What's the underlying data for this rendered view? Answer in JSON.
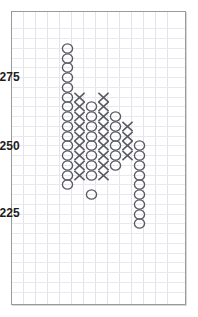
{
  "chart_data": {
    "type": "scatter",
    "chart_style": "point-and-figure",
    "title": "",
    "subtitle": "",
    "xlabel": "",
    "ylabel": "",
    "grid": true,
    "legend": null,
    "y_tick_labels": [
      "275",
      "250",
      "225"
    ],
    "y_tick_values": [
      275,
      250,
      225
    ],
    "ylim": [
      200,
      290
    ],
    "box_size": 3.57,
    "reversal": 3,
    "colors": {
      "symbol": "#595964",
      "grid_vertical": "#e3e3ea",
      "grid_horizontal": "#e8e8ee",
      "frame": "#9a9a9a",
      "background": "#ffffff",
      "label_text": "#1d1d1d"
    },
    "columns": [
      {
        "index": 1,
        "symbol": "O",
        "count": 15,
        "top_value": 282.1,
        "bottom_value": 232.1
      },
      {
        "index": 2,
        "symbol": "X",
        "count": 10,
        "top_value": 267.9,
        "bottom_value": 235.7
      },
      {
        "index": 3,
        "symbol": "O",
        "count": 10,
        "top_value": 264.3,
        "bottom_value": 232.1
      },
      {
        "index": 4,
        "symbol": "X",
        "count": 11,
        "top_value": 267.9,
        "bottom_value": 232.1
      },
      {
        "index": 5,
        "symbol": "O",
        "count": 8,
        "top_value": 264.3,
        "bottom_value": 239.3
      },
      {
        "index": 6,
        "symbol": "X",
        "count": 5,
        "top_value": 257.1,
        "bottom_value": 242.9
      },
      {
        "index": 7,
        "symbol": "O",
        "count": 10,
        "top_value": 253.6,
        "bottom_value": 221.4
      }
    ],
    "points": [
      {
        "col": 1,
        "sym": "O",
        "x": 67,
        "y": 48
      },
      {
        "col": 1,
        "sym": "O",
        "x": 67,
        "y": 58
      },
      {
        "col": 1,
        "sym": "O",
        "x": 67,
        "y": 67
      },
      {
        "col": 1,
        "sym": "O",
        "x": 67,
        "y": 77
      },
      {
        "col": 1,
        "sym": "O",
        "x": 67,
        "y": 87
      },
      {
        "col": 1,
        "sym": "O",
        "x": 67,
        "y": 97
      },
      {
        "col": 1,
        "sym": "O",
        "x": 67,
        "y": 106
      },
      {
        "col": 1,
        "sym": "O",
        "x": 67,
        "y": 116
      },
      {
        "col": 1,
        "sym": "O",
        "x": 67,
        "y": 126
      },
      {
        "col": 1,
        "sym": "O",
        "x": 67,
        "y": 136
      },
      {
        "col": 1,
        "sym": "O",
        "x": 67,
        "y": 145
      },
      {
        "col": 1,
        "sym": "O",
        "x": 67,
        "y": 155
      },
      {
        "col": 1,
        "sym": "O",
        "x": 67,
        "y": 165
      },
      {
        "col": 1,
        "sym": "O",
        "x": 67,
        "y": 175
      },
      {
        "col": 1,
        "sym": "O",
        "x": 67,
        "y": 184
      },
      {
        "col": 2,
        "sym": "X",
        "x": 79,
        "y": 97
      },
      {
        "col": 2,
        "sym": "X",
        "x": 79,
        "y": 106
      },
      {
        "col": 2,
        "sym": "X",
        "x": 79,
        "y": 116
      },
      {
        "col": 2,
        "sym": "X",
        "x": 79,
        "y": 126
      },
      {
        "col": 2,
        "sym": "X",
        "x": 79,
        "y": 136
      },
      {
        "col": 2,
        "sym": "X",
        "x": 79,
        "y": 145
      },
      {
        "col": 2,
        "sym": "X",
        "x": 79,
        "y": 155
      },
      {
        "col": 2,
        "sym": "X",
        "x": 79,
        "y": 165
      },
      {
        "col": 2,
        "sym": "X",
        "x": 79,
        "y": 175
      },
      {
        "col": 3,
        "sym": "O",
        "x": 91,
        "y": 106
      },
      {
        "col": 3,
        "sym": "O",
        "x": 91,
        "y": 116
      },
      {
        "col": 3,
        "sym": "O",
        "x": 91,
        "y": 126
      },
      {
        "col": 3,
        "sym": "O",
        "x": 91,
        "y": 136
      },
      {
        "col": 3,
        "sym": "O",
        "x": 91,
        "y": 145
      },
      {
        "col": 3,
        "sym": "O",
        "x": 91,
        "y": 155
      },
      {
        "col": 3,
        "sym": "O",
        "x": 91,
        "y": 165
      },
      {
        "col": 3,
        "sym": "O",
        "x": 91,
        "y": 175
      },
      {
        "col": 3,
        "sym": "O",
        "x": 91,
        "y": 194
      },
      {
        "col": 4,
        "sym": "X",
        "x": 103,
        "y": 97
      },
      {
        "col": 4,
        "sym": "X",
        "x": 103,
        "y": 106
      },
      {
        "col": 4,
        "sym": "X",
        "x": 103,
        "y": 116
      },
      {
        "col": 4,
        "sym": "X",
        "x": 103,
        "y": 126
      },
      {
        "col": 4,
        "sym": "X",
        "x": 103,
        "y": 136
      },
      {
        "col": 4,
        "sym": "X",
        "x": 103,
        "y": 145
      },
      {
        "col": 4,
        "sym": "X",
        "x": 103,
        "y": 155
      },
      {
        "col": 4,
        "sym": "X",
        "x": 103,
        "y": 165
      },
      {
        "col": 4,
        "sym": "X",
        "x": 103,
        "y": 175
      },
      {
        "col": 5,
        "sym": "O",
        "x": 115,
        "y": 116
      },
      {
        "col": 5,
        "sym": "O",
        "x": 115,
        "y": 126
      },
      {
        "col": 5,
        "sym": "O",
        "x": 115,
        "y": 136
      },
      {
        "col": 5,
        "sym": "O",
        "x": 115,
        "y": 145
      },
      {
        "col": 5,
        "sym": "O",
        "x": 115,
        "y": 155
      },
      {
        "col": 5,
        "sym": "O",
        "x": 115,
        "y": 165
      },
      {
        "col": 6,
        "sym": "X",
        "x": 127,
        "y": 126
      },
      {
        "col": 6,
        "sym": "X",
        "x": 127,
        "y": 136
      },
      {
        "col": 6,
        "sym": "X",
        "x": 127,
        "y": 145
      },
      {
        "col": 6,
        "sym": "X",
        "x": 127,
        "y": 155
      },
      {
        "col": 7,
        "sym": "O",
        "x": 139,
        "y": 145
      },
      {
        "col": 7,
        "sym": "O",
        "x": 139,
        "y": 155
      },
      {
        "col": 7,
        "sym": "O",
        "x": 139,
        "y": 165
      },
      {
        "col": 7,
        "sym": "O",
        "x": 139,
        "y": 175
      },
      {
        "col": 7,
        "sym": "O",
        "x": 139,
        "y": 184
      },
      {
        "col": 7,
        "sym": "O",
        "x": 139,
        "y": 194
      },
      {
        "col": 7,
        "sym": "O",
        "x": 139,
        "y": 204
      },
      {
        "col": 7,
        "sym": "O",
        "x": 139,
        "y": 214
      },
      {
        "col": 7,
        "sym": "O",
        "x": 139,
        "y": 223
      }
    ],
    "gridlines": {
      "vertical_x": [
        23,
        35,
        47,
        59,
        71,
        83,
        95,
        107,
        119,
        131,
        143,
        155,
        167
      ],
      "horizontal_y": [
        28,
        38,
        48,
        58,
        67,
        77,
        87,
        97,
        106,
        116,
        126,
        136,
        145,
        155,
        165,
        175,
        184,
        194,
        204,
        214,
        223,
        233,
        243,
        253,
        262,
        272,
        282,
        292
      ]
    },
    "axis_labels": [
      {
        "text": "275",
        "x": 20,
        "y": 71
      },
      {
        "text": "250",
        "x": 20,
        "y": 140
      },
      {
        "text": "225",
        "x": 20,
        "y": 207
      }
    ]
  }
}
